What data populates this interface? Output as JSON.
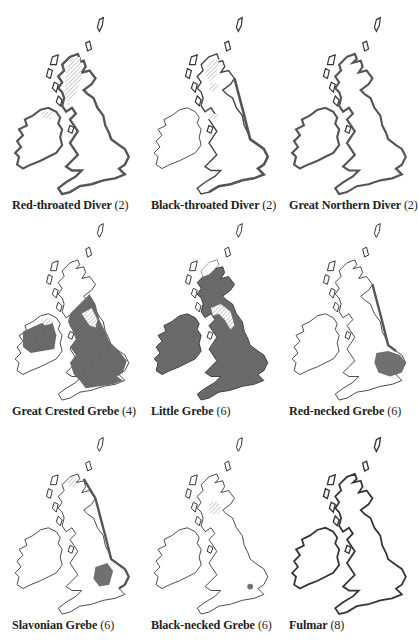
{
  "page": {
    "figures": [
      {
        "name": "Red-throated Diver",
        "ref": "(2)",
        "row": 0,
        "col": 0,
        "overlay": "hatch-north-scotland",
        "coast_emphasis": "full-heavy"
      },
      {
        "name": "Black-throated Diver",
        "ref": "(2)",
        "row": 0,
        "col": 1,
        "overlay": "hatch-highlands-small",
        "coast_emphasis": "east-south-heavy"
      },
      {
        "name": "Great Northern Diver",
        "ref": "(2)",
        "row": 0,
        "col": 2,
        "overlay": "none",
        "coast_emphasis": "full-heavy"
      },
      {
        "name": "Great Crested Grebe",
        "ref": "(4)",
        "row": 1,
        "col": 0,
        "overlay": "solid-england-ireland",
        "coast_emphasis": "light"
      },
      {
        "name": "Little Grebe",
        "ref": "(6)",
        "row": 1,
        "col": 1,
        "overlay": "solid-almost-all",
        "coast_emphasis": "light"
      },
      {
        "name": "Red-necked Grebe",
        "ref": "(6)",
        "row": 1,
        "col": 2,
        "overlay": "solid-east-anglia",
        "coast_emphasis": "east-heavy"
      },
      {
        "name": "Slavonian Grebe",
        "ref": "(6)",
        "row": 2,
        "col": 0,
        "overlay": "solid-midlands-patch",
        "coast_emphasis": "east-heavy"
      },
      {
        "name": "Black-necked Grebe",
        "ref": "(6)",
        "row": 2,
        "col": 1,
        "overlay": "hatch-firth-of-forth-dot-south",
        "coast_emphasis": "light"
      },
      {
        "name": "Fulmar",
        "ref": "(8)",
        "row": 2,
        "col": 2,
        "overlay": "none",
        "coast_emphasis": "full-heavy"
      }
    ]
  },
  "colors": {
    "ink": "#2a2a2a",
    "fill": "#6b6b6b",
    "hatch": "#9a9a9a"
  }
}
